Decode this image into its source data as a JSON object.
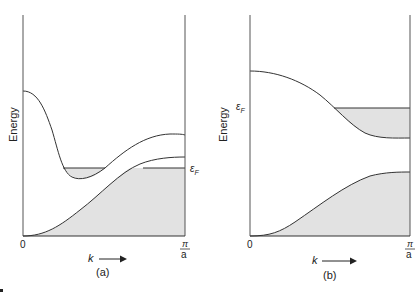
{
  "figure": {
    "panels": [
      {
        "id": "a",
        "caption": "(a)",
        "y_axis_label": "Energy",
        "x_axis_label": "k",
        "x_tick_start": "0",
        "x_tick_end_numerator": "π",
        "x_tick_end_denominator": "a",
        "fermi_label": "ε",
        "fermi_subscript": "F",
        "description": "Two overlapping bands: lower band filled up to Fermi level near zone boundary; upper band minimum dips below Fermi level forming a small filled pocket"
      },
      {
        "id": "b",
        "caption": "(b)",
        "y_axis_label": "Energy",
        "x_axis_label": "k",
        "x_tick_start": "0",
        "x_tick_end_numerator": "π",
        "x_tick_end_denominator": "a",
        "fermi_label": "ε",
        "fermi_subscript": "F",
        "description": "Two bands separated by a gap: lower band fully filled; upper band partially filled near zone boundary up to Fermi level"
      }
    ],
    "colors": {
      "line": "#333333",
      "fill": "#e2e2e2",
      "background": "#ffffff"
    }
  }
}
